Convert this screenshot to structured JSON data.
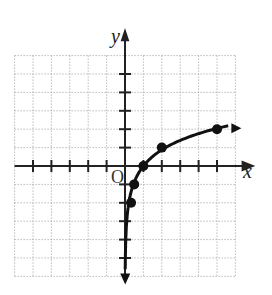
{
  "chart_data": {
    "type": "line",
    "title": "",
    "xlabel": "x",
    "ylabel": "y",
    "origin_label": "O",
    "xlim": [
      -6,
      6
    ],
    "ylim": [
      -6,
      6
    ],
    "grid": true,
    "grid_style": "dotted",
    "points": [
      {
        "x": 0.33,
        "y": -2
      },
      {
        "x": 0.5,
        "y": -1
      },
      {
        "x": 1,
        "y": 0
      },
      {
        "x": 2,
        "y": 1
      },
      {
        "x": 5,
        "y": 2
      }
    ],
    "curve": "logarithmic, vertical asymptote x=0, arrows at both ends"
  }
}
